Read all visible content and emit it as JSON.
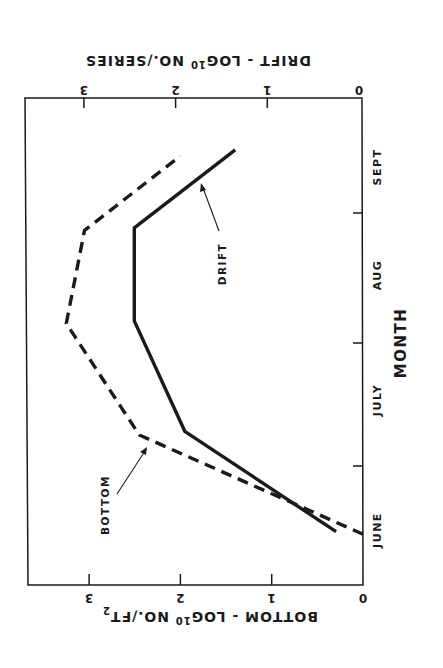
{
  "chart_data": {
    "type": "line",
    "orientation": "rotated 90 degrees (month axis vertical along right edge; value axes along top and bottom)",
    "title": "",
    "xlabel": "MONTH",
    "categories": [
      "JUNE",
      "JULY",
      "AUG",
      "SEPT"
    ],
    "axes": {
      "bottom_value_axis": {
        "label_main": "BOTTOM - LOG",
        "label_sub": "10",
        "label_tail": " NO./FT",
        "label_sup": "2",
        "ticks": [
          "0",
          "1",
          "2",
          "3"
        ],
        "range": [
          0,
          3.5
        ]
      },
      "drift_value_axis": {
        "label_main": "DRIFT - LOG",
        "label_sub": "10",
        "label_tail": " NO./SERIES",
        "ticks": [
          "0",
          "1",
          "2",
          "3"
        ],
        "range": [
          0,
          3.5
        ]
      }
    },
    "series": [
      {
        "name": "BOTTOM",
        "style": "dashed",
        "axis": "bottom",
        "points": [
          {
            "month_pos": 0.45,
            "value": 0.0
          },
          {
            "month_pos": 1.25,
            "value": 2.45
          },
          {
            "month_pos": 2.15,
            "value": 3.25
          },
          {
            "month_pos": 2.9,
            "value": 3.05
          },
          {
            "month_pos": 3.5,
            "value": 2.0
          }
        ]
      },
      {
        "name": "DRIFT",
        "style": "solid",
        "axis": "drift",
        "points": [
          {
            "month_pos": 0.47,
            "value": 0.25
          },
          {
            "month_pos": 1.28,
            "value": 1.9
          },
          {
            "month_pos": 2.17,
            "value": 2.45
          },
          {
            "month_pos": 2.92,
            "value": 2.45
          },
          {
            "month_pos": 3.55,
            "value": 1.35
          }
        ]
      }
    ],
    "annotations": [
      {
        "text": "BOTTOM",
        "points_to": "dashed line near JULY"
      },
      {
        "text": "DRIFT",
        "points_to": "solid line between AUG and SEPT"
      }
    ],
    "grid": false,
    "legend": "none (inline labels with arrows)"
  },
  "labels": {
    "month_title": "MONTH",
    "months": [
      "JUNE",
      "JULY",
      "AUG",
      "SEPT"
    ],
    "ticks": [
      "0",
      "1",
      "2",
      "3"
    ],
    "bottom_series": "BOTTOM",
    "drift_series": "DRIFT"
  }
}
